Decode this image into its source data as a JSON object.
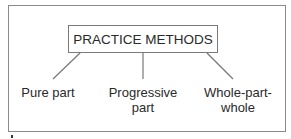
{
  "diagram": {
    "root": {
      "label": "PRACTICE METHODS"
    },
    "children": [
      {
        "label_lines": [
          "Pure part"
        ]
      },
      {
        "label_lines": [
          "Progressive",
          "part"
        ]
      },
      {
        "label_lines": [
          "Whole-part-",
          "whole"
        ]
      }
    ]
  }
}
